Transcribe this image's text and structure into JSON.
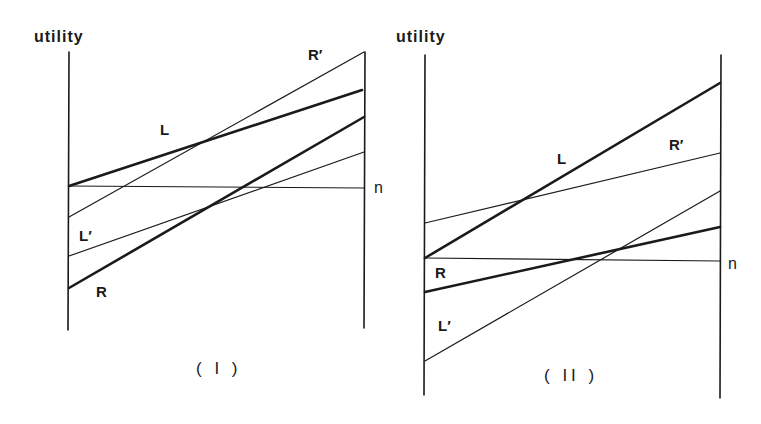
{
  "panels": [
    {
      "id": "I",
      "caption": "( I )",
      "y_label": "utility",
      "lines": {
        "L": {
          "label": "L",
          "weight": "thick"
        },
        "R": {
          "label": "R",
          "weight": "thick"
        },
        "Lp": {
          "label": "L′",
          "weight": "thin"
        },
        "Rp": {
          "label": "R′",
          "weight": "thin"
        },
        "n": {
          "label": "n",
          "weight": "thin"
        }
      }
    },
    {
      "id": "II",
      "caption": "( II )",
      "y_label": "utility",
      "lines": {
        "L": {
          "label": "L",
          "weight": "thick"
        },
        "R": {
          "label": "R",
          "weight": "thick"
        },
        "Lp": {
          "label": "L′",
          "weight": "thin"
        },
        "Rp": {
          "label": "R′",
          "weight": "thin"
        },
        "n": {
          "label": "n",
          "weight": "thin"
        }
      }
    }
  ],
  "colors": {
    "ink": "#1a1a1a",
    "background": "#ffffff"
  }
}
